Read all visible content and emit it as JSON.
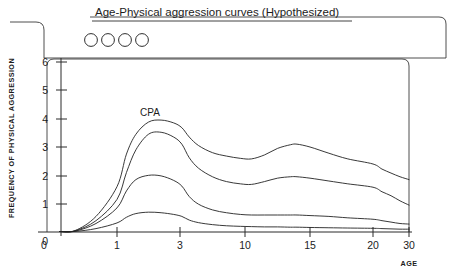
{
  "figure": {
    "title": "Age-Physical aggression curves (Hypothesized)",
    "marker_count": 4,
    "markers": [
      "legend-circle-1",
      "legend-circle-2",
      "legend-circle-3",
      "legend-circle-4"
    ]
  },
  "chart_data": {
    "type": "line",
    "title": "Age-Physical aggression curves (Hypothesized)",
    "xlabel": "AGE",
    "ylabel": "FREQUENCY OF PHYSICAL AGGRESSION",
    "xticks": [
      0,
      1,
      3,
      10,
      15,
      20,
      30
    ],
    "xtick_labels": [
      "0",
      "1",
      "3",
      "10",
      "15",
      "20",
      "30"
    ],
    "yticks": [
      0,
      1,
      2,
      3,
      4,
      5,
      6
    ],
    "ytick_labels": [
      "0",
      "1",
      "2",
      "3",
      "4",
      "5",
      "6"
    ],
    "xlim": [
      0,
      30
    ],
    "ylim": [
      0,
      6.2
    ],
    "x_axis_scale": "nonlinear-compressed",
    "grid": false,
    "legend": "none",
    "annotations": [
      {
        "text": "CPA",
        "x": 2.1,
        "y": 4.45,
        "name": "cpa-curve-label"
      }
    ],
    "x": [
      0.4,
      0.7,
      1.0,
      1.3,
      1.6,
      2.0,
      2.4,
      2.8,
      3.2,
      4.0,
      5.0,
      6.5,
      8.0,
      9.5,
      10.5,
      11.5,
      12.5,
      13.5,
      14.0,
      15.0,
      16.5,
      18.0,
      20.0,
      22.5,
      25.0,
      27.5,
      30.0
    ],
    "series": [
      {
        "name": "CPA (highest trajectory)",
        "values": [
          0.05,
          0.55,
          1.6,
          2.75,
          3.45,
          3.88,
          3.95,
          3.85,
          3.68,
          3.35,
          3.05,
          2.8,
          2.68,
          2.6,
          2.58,
          2.72,
          2.95,
          3.08,
          3.1,
          3.0,
          2.78,
          2.58,
          2.4,
          2.22,
          2.08,
          1.95,
          1.85
        ]
      },
      {
        "name": "Second trajectory",
        "values": [
          0.04,
          0.4,
          1.15,
          2.1,
          2.9,
          3.45,
          3.52,
          3.35,
          3.1,
          2.62,
          2.25,
          1.95,
          1.78,
          1.7,
          1.68,
          1.78,
          1.9,
          1.95,
          1.95,
          1.9,
          1.8,
          1.7,
          1.58,
          1.42,
          1.28,
          1.1,
          0.95
        ]
      },
      {
        "name": "Third trajectory",
        "values": [
          0.03,
          0.3,
          0.85,
          1.45,
          1.85,
          2.0,
          1.98,
          1.82,
          1.62,
          1.25,
          0.98,
          0.78,
          0.68,
          0.62,
          0.6,
          0.6,
          0.6,
          0.6,
          0.6,
          0.58,
          0.55,
          0.5,
          0.45,
          0.4,
          0.35,
          0.3,
          0.28
        ]
      },
      {
        "name": "Fourth trajectory (lowest)",
        "values": [
          0.02,
          0.12,
          0.32,
          0.52,
          0.65,
          0.7,
          0.68,
          0.62,
          0.55,
          0.42,
          0.33,
          0.26,
          0.22,
          0.2,
          0.19,
          0.18,
          0.18,
          0.17,
          0.17,
          0.16,
          0.15,
          0.14,
          0.13,
          0.12,
          0.11,
          0.1,
          0.1
        ]
      }
    ]
  }
}
